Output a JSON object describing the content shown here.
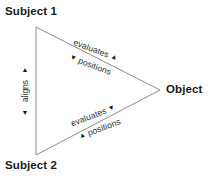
{
  "diagram": {
    "type": "triangle-relationship-diagram",
    "background_color": "#ffffff",
    "line_color": "#8c8c8c",
    "text_color": "#1a1a1a",
    "nodes": [
      {
        "id": "subject1",
        "label": "Subject 1",
        "position": "top-left"
      },
      {
        "id": "subject2",
        "label": "Subject 2",
        "position": "bottom-left"
      },
      {
        "id": "object",
        "label": "Object",
        "position": "right"
      }
    ],
    "edges": [
      {
        "id": "left-edge",
        "from": "subject1",
        "to": "subject2",
        "orientation": "vertical",
        "labels": [
          {
            "text": "aligns",
            "arrow_before": "▲",
            "arrow_after": "▼"
          }
        ]
      },
      {
        "id": "upper-edge",
        "from": "subject1",
        "to": "object",
        "orientation": "diagonal-down-right",
        "labels": [
          {
            "text": "evaluates",
            "arrow_after": "▲"
          },
          {
            "text": "positions",
            "arrow_before": "▼"
          }
        ]
      },
      {
        "id": "lower-edge",
        "from": "subject2",
        "to": "object",
        "orientation": "diagonal-up-right",
        "labels": [
          {
            "text": "evaluates",
            "arrow_after": "▼"
          },
          {
            "text": "positions",
            "arrow_before": "▲"
          }
        ]
      }
    ]
  },
  "arrows": {
    "up": "▲",
    "down": "▼"
  }
}
